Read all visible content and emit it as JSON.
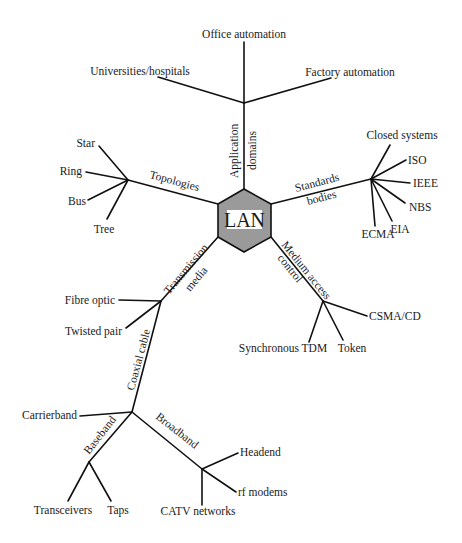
{
  "hub": {
    "label": "LAN",
    "fill": "#9a9a9a"
  },
  "branches": {
    "application": {
      "label_line1": "Application",
      "label_line2": "domains",
      "leaves": [
        "Office automation",
        "Universities/hospitals",
        "Factory automation"
      ]
    },
    "topologies": {
      "label": "Topologies",
      "leaves": [
        "Star",
        "Ring",
        "Bus",
        "Tree"
      ]
    },
    "standards": {
      "label_line1": "Standards",
      "label_line2": "bodies",
      "leaves": [
        "Closed systems",
        "ISO",
        "IEEE",
        "NBS",
        "EIA",
        "ECMA"
      ]
    },
    "mac": {
      "label_line1": "Medium access",
      "label_line2": "control",
      "leaves": [
        "CSMA/CD",
        "Token",
        "Synchronous TDM"
      ]
    },
    "transmission": {
      "label_line1": "Transmission",
      "label_line2": "media",
      "leaves": [
        "Fibre optic",
        "Twisted pair"
      ],
      "coaxial": {
        "label": "Coaxial cable",
        "leaves": [
          "Carrierband"
        ],
        "baseband": {
          "label": "Baseband",
          "leaves": [
            "Transceivers",
            "Taps"
          ]
        },
        "broadband": {
          "label": "Broadband",
          "leaves": [
            "Headend",
            "rf modems",
            "CATV networks"
          ]
        }
      }
    }
  }
}
